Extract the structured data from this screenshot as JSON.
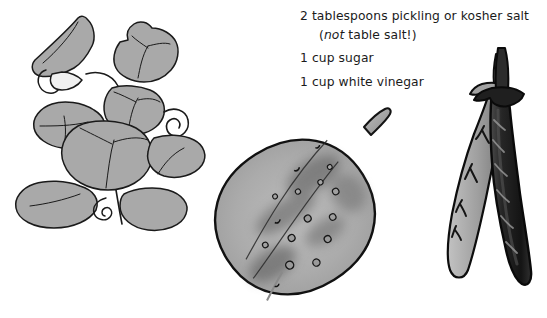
{
  "page": {
    "background_color": "#ffffff",
    "width": 547,
    "height": 318
  },
  "recipe": {
    "heading": "Pour the mixture:",
    "heading_clipped": true,
    "ingredients": [
      {
        "id": "salt",
        "text": "2 tablespoons pickling or kosher salt",
        "note_prefix": "(",
        "note_emphasis": "not",
        "note_suffix": " table salt!)"
      },
      {
        "id": "sugar",
        "text": "1 cup sugar"
      },
      {
        "id": "vinegar",
        "text": "1 cup white vinegar"
      }
    ]
  },
  "illustrations": [
    {
      "id": "plant",
      "name": "cucumber-plant-illustration",
      "caption": "Cucumber vine with broad lobed leaves and curling tendrils",
      "style": "grey-filled line art",
      "fill_color": "#a9a9a9",
      "outline_color": "#1a1a1a",
      "highlight_color": "#c8c8c8"
    },
    {
      "id": "cucumber",
      "name": "cucumber-illustration",
      "caption": "Single pickling cucumber with warty bumps and a short stem",
      "style": "grey mottled drawing",
      "fill_color": "#b2b2b2",
      "shadow_color": "#7a7a7a",
      "outline_color": "#111111"
    },
    {
      "id": "peppers",
      "name": "peppers-illustration",
      "caption": "Two crossed chili peppers, one dark and one pale grey",
      "style": "high-contrast grayscale photo cutout",
      "dark_color": "#1d1d1d",
      "light_color": "#9c9c9c",
      "outline_color": "#0d0d0d"
    }
  ],
  "colors": {
    "text": "#1b1b1b",
    "paper": "#ffffff",
    "leaf_grey": "#a9a9a9",
    "cucumber_grey": "#b2b2b2",
    "pepper_dark": "#1d1d1d"
  }
}
